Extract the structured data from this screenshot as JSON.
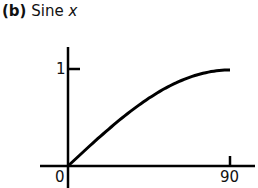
{
  "title": {
    "tag": "(b)",
    "text": "Sine",
    "variable": "x"
  },
  "chart_data": {
    "type": "line",
    "title": "(b) Sine x",
    "xlabel": "",
    "ylabel": "",
    "x_ticks": [
      "0",
      "90"
    ],
    "y_ticks": [
      "1"
    ],
    "xlim": [
      0,
      90
    ],
    "ylim": [
      0,
      1
    ],
    "grid": false,
    "series": [
      {
        "name": "sin x",
        "x": [
          0,
          15,
          30,
          45,
          60,
          75,
          90
        ],
        "values": [
          0,
          0.259,
          0.5,
          0.707,
          0.866,
          0.966,
          1.0
        ]
      }
    ]
  },
  "axis_labels": {
    "x0": "0",
    "x90": "90",
    "y1": "1"
  }
}
